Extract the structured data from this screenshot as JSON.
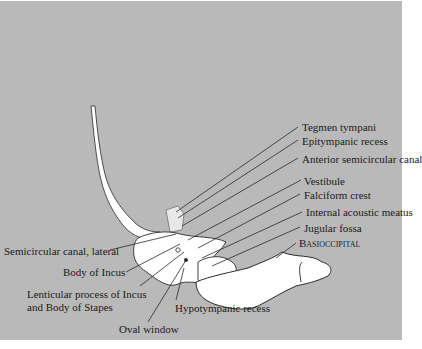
{
  "figure": {
    "background_color": "#b9b9b9",
    "bone_color": "#ffffff",
    "line_color": "#1a1a1a"
  },
  "labels_right": [
    {
      "text": "Tegmen tympani"
    },
    {
      "text": "Epitympanic recess"
    },
    {
      "text": "Anterior semicircular canal"
    },
    {
      "text": "Vestibule"
    },
    {
      "text": "Falciform crest"
    },
    {
      "text": "Internal acoustic meatus"
    },
    {
      "text": "Jugular fossa"
    },
    {
      "text": "Basioccipital"
    }
  ],
  "labels_left": [
    {
      "text": "Semicircular canal, lateral"
    },
    {
      "text": "Body of Incus"
    },
    {
      "text": "Lenticular process of Incus"
    },
    {
      "text": "and Body of Stapes"
    }
  ],
  "labels_bottom": [
    {
      "text": "Hypotympanic recess"
    },
    {
      "text": "Oval window"
    }
  ]
}
